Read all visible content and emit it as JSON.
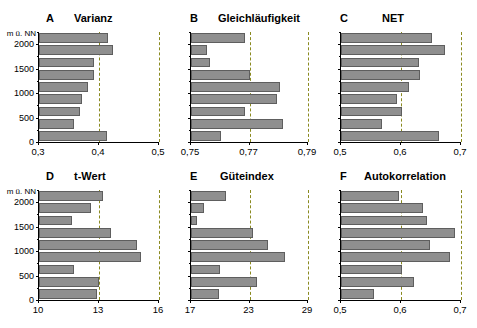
{
  "figure": {
    "y_axis_caption": "m ü. NN",
    "y_ticks": [
      "0",
      "500",
      "1000",
      "1500",
      "2000"
    ],
    "y_tick_values": [
      0,
      500,
      1000,
      1500,
      2000
    ],
    "bar_color": "#8f8f8f",
    "bar_edge_color": "#5e5e5e",
    "gridline_color": "#8a8a20",
    "axis_color": "#000000"
  },
  "chart_data": [
    {
      "type": "bar",
      "panel": "A",
      "title": "Varianz",
      "orientation": "horizontal",
      "ylabel": "m ü. NN",
      "xlabel": "",
      "xlim": [
        0.3,
        0.5
      ],
      "xticks": [
        0.3,
        0.4,
        0.5
      ],
      "xticklabels": [
        "0,3",
        "0,4",
        "0,5"
      ],
      "ylim": [
        0,
        2250
      ],
      "grid": true,
      "categories": [
        "0-250",
        "250-500",
        "500-750",
        "750-1000",
        "1000-1250",
        "1250-1500",
        "1500-1750",
        "1750-2000",
        "2000-2250"
      ],
      "values": [
        0.413,
        0.358,
        0.369,
        0.371,
        0.381,
        0.392,
        0.392,
        0.424,
        0.415
      ]
    },
    {
      "type": "bar",
      "panel": "B",
      "title": "Gleichläufigkeit",
      "orientation": "horizontal",
      "ylabel": "m ü. NN",
      "xlabel": "",
      "xlim": [
        0.75,
        0.79
      ],
      "xticks": [
        0.75,
        0.77,
        0.79
      ],
      "xticklabels": [
        "0,75",
        "0,77",
        "0,79"
      ],
      "ylim": [
        0,
        2250
      ],
      "grid": true,
      "categories": [
        "0-250",
        "250-500",
        "500-750",
        "750-1000",
        "1000-1250",
        "1250-1500",
        "1500-1750",
        "1750-2000",
        "2000-2250"
      ],
      "values": [
        0.7603,
        0.7813,
        0.7686,
        0.7793,
        0.7805,
        0.77,
        0.7565,
        0.7554,
        0.7685
      ]
    },
    {
      "type": "bar",
      "panel": "C",
      "title": "NET",
      "orientation": "horizontal",
      "ylabel": "m ü. NN",
      "xlabel": "",
      "xlim": [
        0.5,
        0.7
      ],
      "xticks": [
        0.5,
        0.6,
        0.7
      ],
      "xticklabels": [
        "0,5",
        "0,6",
        "0,7"
      ],
      "ylim": [
        0,
        2250
      ],
      "grid": true,
      "categories": [
        "0-250",
        "250-500",
        "500-750",
        "750-1000",
        "1000-1250",
        "1250-1500",
        "1500-1750",
        "1750-2000",
        "2000-2250"
      ],
      "values": [
        0.663,
        0.568,
        0.602,
        0.593,
        0.613,
        0.632,
        0.63,
        0.673,
        0.652
      ]
    },
    {
      "type": "bar",
      "panel": "D",
      "title": "t-Wert",
      "orientation": "horizontal",
      "ylabel": "m ü. NN",
      "xlabel": "",
      "xlim": [
        10,
        16
      ],
      "xticks": [
        10,
        13,
        16
      ],
      "xticklabels": [
        "10",
        "13",
        "16"
      ],
      "ylim": [
        0,
        2250
      ],
      "grid": true,
      "categories": [
        "0-250",
        "250-500",
        "500-750",
        "750-1000",
        "1000-1250",
        "1250-1500",
        "1500-1750",
        "1750-2000",
        "2000-2250"
      ],
      "values": [
        12.9,
        13.0,
        11.75,
        15.1,
        14.9,
        13.6,
        11.65,
        12.6,
        13.2
      ]
    },
    {
      "type": "bar",
      "panel": "E",
      "title": "Güteindex",
      "orientation": "horizontal",
      "ylabel": "m ü. NN",
      "xlabel": "",
      "xlim": [
        17,
        29
      ],
      "xticks": [
        17,
        23,
        29
      ],
      "xticklabels": [
        "17",
        "23",
        "29"
      ],
      "ylim": [
        0,
        2250
      ],
      "grid": true,
      "categories": [
        "0-250",
        "250-500",
        "500-750",
        "750-1000",
        "1000-1250",
        "1250-1500",
        "1500-1750",
        "1750-2000",
        "2000-2250"
      ],
      "values": [
        19.9,
        23.8,
        20.0,
        26.6,
        24.9,
        23.4,
        17.6,
        18.3,
        20.6
      ]
    },
    {
      "type": "bar",
      "panel": "F",
      "title": "Autokorrelation",
      "orientation": "horizontal",
      "ylabel": "m ü. NN",
      "xlabel": "",
      "xlim": [
        0.5,
        0.7
      ],
      "xticks": [
        0.5,
        0.6,
        0.7
      ],
      "xticklabels": [
        "0,5",
        "0,6",
        "0,7"
      ],
      "ylim": [
        0,
        2250
      ],
      "grid": true,
      "categories": [
        "0-250",
        "250-500",
        "500-750",
        "750-1000",
        "1000-1250",
        "1250-1500",
        "1500-1750",
        "1750-2000",
        "2000-2250"
      ],
      "values": [
        0.555,
        0.622,
        0.602,
        0.681,
        0.648,
        0.69,
        0.644,
        0.636,
        0.596
      ]
    }
  ],
  "layout": {
    "panels": [
      {
        "key": "A",
        "left": 38,
        "top": 12,
        "plot_left": 38,
        "plot_top": 32,
        "plot_w": 120,
        "plot_h": 110,
        "letter_x": 8,
        "title_x": 36,
        "show_y_labels": true
      },
      {
        "key": "B",
        "left": 190,
        "top": 12,
        "plot_left": 190,
        "plot_top": 32,
        "plot_w": 117,
        "plot_h": 110,
        "letter_x": 0,
        "title_x": 28,
        "show_y_labels": false
      },
      {
        "key": "C",
        "left": 340,
        "top": 12,
        "plot_left": 340,
        "plot_top": 32,
        "plot_w": 120,
        "plot_h": 110,
        "letter_x": 0,
        "title_x": 42,
        "show_y_labels": false
      },
      {
        "key": "D",
        "left": 38,
        "top": 170,
        "plot_left": 38,
        "plot_top": 190,
        "plot_w": 120,
        "plot_h": 110,
        "letter_x": 8,
        "title_x": 36,
        "show_y_labels": true
      },
      {
        "key": "E",
        "left": 190,
        "top": 170,
        "plot_left": 190,
        "plot_top": 190,
        "plot_w": 117,
        "plot_h": 110,
        "letter_x": 0,
        "title_x": 30,
        "show_y_labels": false
      },
      {
        "key": "F",
        "left": 340,
        "top": 170,
        "plot_left": 340,
        "plot_top": 190,
        "plot_w": 120,
        "plot_h": 110,
        "letter_x": 0,
        "title_x": 24,
        "show_y_labels": false
      }
    ]
  }
}
